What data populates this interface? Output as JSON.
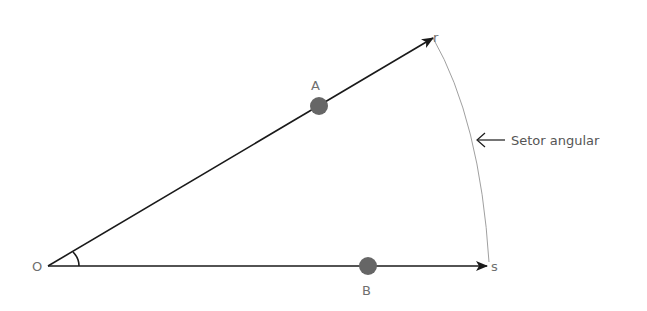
{
  "diagram": {
    "title": "Setor angular",
    "vertex": {
      "label": "O",
      "x": 48,
      "y": 266
    },
    "rays": [
      {
        "name": "r",
        "label": "r",
        "from": [
          48,
          266
        ],
        "to": [
          433,
          38
        ]
      },
      {
        "name": "s",
        "label": "s",
        "from": [
          48,
          266
        ],
        "to": [
          489,
          266
        ]
      }
    ],
    "points": [
      {
        "label": "A",
        "x": 319,
        "y": 106,
        "on_ray": "r"
      },
      {
        "label": "B",
        "x": 368,
        "y": 266,
        "on_ray": "s"
      }
    ],
    "sector_arc": {
      "from": [
        433,
        38
      ],
      "to": [
        489,
        262
      ]
    },
    "annotation": {
      "text": "Setor angular",
      "arrow_from": [
        505,
        140
      ],
      "arrow_to": [
        476,
        140
      ]
    },
    "colors": {
      "ray": "#1a1a1a",
      "point": "#666666",
      "arc": "#9a9a9a",
      "label": "#6f6f6f"
    }
  }
}
